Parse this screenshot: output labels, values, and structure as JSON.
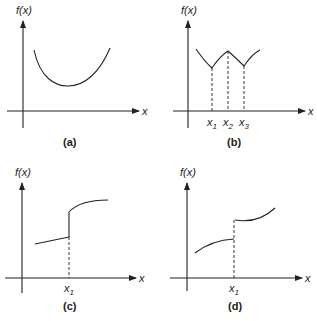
{
  "panels": [
    {
      "id": "a",
      "caption": "(a)",
      "y_label": "f(x)",
      "x_label": "x",
      "description": "smooth convex curve with single minimum",
      "marks": []
    },
    {
      "id": "b",
      "caption": "(b)",
      "y_label": "f(x)",
      "x_label": "x",
      "description": "piecewise curve with cusps: minima at x1 and x3, maximum at x2",
      "marks": [
        {
          "name": "x",
          "sub": "1"
        },
        {
          "name": "x",
          "sub": "2"
        },
        {
          "name": "x",
          "sub": "3"
        }
      ]
    },
    {
      "id": "c",
      "caption": "(c)",
      "y_label": "f(x)",
      "x_label": "x",
      "description": "linear segment with jump discontinuity upward at x1, then concave curve",
      "marks": [
        {
          "name": "x",
          "sub": "1"
        }
      ]
    },
    {
      "id": "d",
      "caption": "(d)",
      "y_label": "f(x)",
      "x_label": "x",
      "description": "concave curve with jump discontinuity upward at x1, then rising curve",
      "marks": [
        {
          "name": "x",
          "sub": "1"
        }
      ]
    }
  ],
  "colors": {
    "stroke": "#222222",
    "background": "#ffffff"
  }
}
